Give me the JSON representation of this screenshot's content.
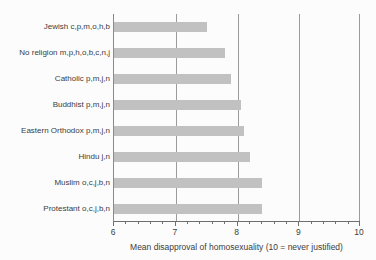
{
  "chart_data": {
    "type": "bar",
    "orientation": "horizontal",
    "title": "",
    "xlabel": "Mean disapproval of homosexuality (10 = never justified)",
    "ylabel": "",
    "categories": [
      "Jewish c,p,m,o,h,b",
      "No religion m,p,h,o,b,c,n,j",
      "Catholic p,m,j,n",
      "Buddhist p,m,j,n",
      "Eastern Orthodox p,m,j,n",
      "Hindu j,n",
      "Muslim o,c,j,b,n",
      "Protestant o,c,j,b,n"
    ],
    "values": [
      7.5,
      7.8,
      7.9,
      8.05,
      8.1,
      8.2,
      8.4,
      8.4
    ],
    "xlim": [
      6,
      10
    ],
    "x_major_ticks": [
      "6",
      "7",
      "8",
      "9",
      "10"
    ],
    "x_major_tick_values": [
      6,
      7,
      8,
      9,
      10
    ],
    "x_minor_tick_step": 0.2,
    "gridlines_at": [
      7,
      8,
      9,
      10
    ],
    "grid": "vertical-only",
    "legend_position": "none",
    "colors": {
      "bar": "#c1c1c1",
      "gridline": "#9b9b9b",
      "axis": "#6f6f6f",
      "text": "#3d3d3d",
      "background": "#fcfcfc"
    }
  }
}
